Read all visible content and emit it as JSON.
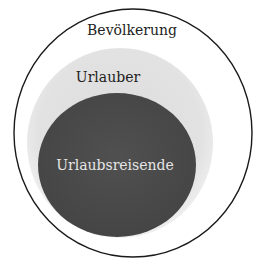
{
  "diagram": {
    "type": "nested-set-diagram",
    "sets": [
      {
        "id": "outer",
        "label": "Bevölkerung",
        "fill": "#ffffff",
        "stroke": "#1a1a1a"
      },
      {
        "id": "middle",
        "label": "Urlauber",
        "fill": "#e4e4e4",
        "stroke": "none"
      },
      {
        "id": "inner",
        "label": "Urlaubsreisende",
        "fill": "#4a4a4a",
        "stroke": "none"
      }
    ]
  }
}
